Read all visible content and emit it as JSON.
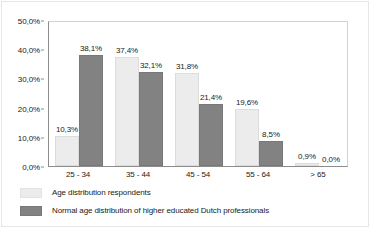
{
  "chart_data": {
    "type": "bar",
    "title": "",
    "subtitle": "",
    "xlabel": "",
    "ylabel": "",
    "categories": [
      "25 - 34",
      "35 - 44",
      "45 - 54",
      "55 - 64",
      "> 65"
    ],
    "series": [
      {
        "name": "Age distribution respondents",
        "color": "#ececec",
        "values": [
          10.3,
          37.4,
          31.8,
          19.6,
          0.9
        ],
        "labels": [
          "10,3%",
          "37,4%",
          "31,8%",
          "19,6%",
          "0,9%"
        ]
      },
      {
        "name": "Normal age distribution of higher educated Dutch professionals",
        "color": "#828282",
        "values": [
          38.1,
          32.1,
          21.4,
          8.5,
          0.0
        ],
        "labels": [
          "38,1%",
          "32,1%",
          "21,4%",
          "8,5%",
          "0,0%"
        ]
      }
    ],
    "ylim": [
      0,
      50
    ],
    "ytick_values": [
      0,
      10,
      20,
      30,
      40,
      50
    ],
    "ytick_labels": [
      "0,0%",
      "10,0%",
      "20,0%",
      "30,0%",
      "40,0%",
      "50,0%"
    ],
    "grid": false,
    "legend_position": "bottom-left",
    "axis_color": "#8c8c8c"
  }
}
